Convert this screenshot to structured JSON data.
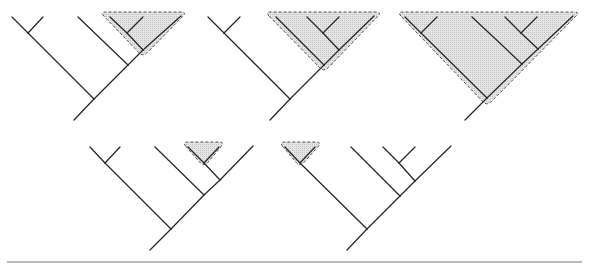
{
  "figure": {
    "colors": {
      "branch": "#2a2a2a",
      "clade_fill": "#d9d9d9",
      "clade_border": "#555555",
      "rule": "#777777"
    }
  },
  "trees": [
    {
      "id": "tree-1",
      "topology": "((A,B),(C,((D,E),F)))",
      "highlighted_clade": "(D,E),F",
      "root": [
        74,
        120
      ],
      "nodes": {
        "n1": [
          94,
          99
        ],
        "nAB": [
          28,
          33
        ],
        "n2": [
          128,
          65
        ],
        "n3": [
          143,
          50
        ],
        "nDE": [
          127,
          33
        ]
      },
      "leaves": {
        "A": [
          12,
          17
        ],
        "B": [
          43,
          17
        ],
        "C": [
          78,
          17
        ],
        "D": [
          110,
          17
        ],
        "E": [
          143,
          17
        ],
        "F": [
          181,
          16
        ]
      },
      "clade_shape": [
        [
          100,
          12
        ],
        [
          187,
          12
        ],
        [
          143,
          57
        ]
      ]
    },
    {
      "id": "tree-2",
      "topology": "((A,B),(C,((D,E),F)))",
      "highlighted_clade": "C,((D,E),F)",
      "root": [
        270,
        120
      ],
      "nodes": {
        "n1": [
          290,
          99
        ],
        "nAB": [
          224,
          33
        ],
        "n2": [
          324,
          65
        ],
        "n3": [
          339,
          50
        ],
        "nDE": [
          323,
          33
        ]
      },
      "leaves": {
        "A": [
          208,
          17
        ],
        "B": [
          240,
          17
        ],
        "C": [
          276,
          17
        ],
        "D": [
          307,
          17
        ],
        "E": [
          339,
          17
        ],
        "F": [
          374,
          16
        ]
      },
      "clade_shape": [
        [
          265,
          12
        ],
        [
          382,
          12
        ],
        [
          324,
          72
        ]
      ]
    },
    {
      "id": "tree-3",
      "topology": "((A,B),(C,((D,E),F)))",
      "highlighted_clade": "entire tree",
      "root": [
        465,
        120
      ],
      "nodes": {
        "n1": [
          487,
          98
        ],
        "nAB": [
          421,
          33
        ],
        "n2": [
          522,
          64
        ],
        "n3": [
          538,
          49
        ],
        "nDE": [
          521,
          33
        ]
      },
      "leaves": {
        "A": [
          405,
          17
        ],
        "B": [
          437,
          17
        ],
        "C": [
          472,
          17
        ],
        "D": [
          505,
          17
        ],
        "E": [
          537,
          17
        ],
        "F": [
          573,
          16
        ]
      },
      "clade_shape": [
        [
          397,
          12
        ],
        [
          580,
          12
        ],
        [
          487,
          106
        ]
      ]
    },
    {
      "id": "tree-4",
      "topology": "((A,B),(C,((D,E),F)))",
      "highlighted_clade": "D,E",
      "root": [
        150,
        250
      ],
      "nodes": {
        "n1": [
          171,
          229
        ],
        "nAB": [
          105,
          163
        ],
        "n2": [
          204,
          195
        ],
        "n3": [
          220,
          180
        ],
        "nDE": [
          204,
          163
        ]
      },
      "leaves": {
        "A": [
          90,
          147
        ],
        "B": [
          120,
          147
        ],
        "C": [
          155,
          147
        ],
        "D": [
          188,
          147
        ],
        "E": [
          219,
          147
        ],
        "F": [
          253,
          146
        ]
      },
      "clade_shape": [
        [
          182,
          142
        ],
        [
          225,
          142
        ],
        [
          204,
          167
        ]
      ]
    },
    {
      "id": "tree-5",
      "topology": "((A,B),(C,((D,E),F)))",
      "highlighted_clade": "A,B",
      "root": [
        347,
        250
      ],
      "nodes": {
        "n1": [
          367,
          229
        ],
        "nAB": [
          300,
          163
        ],
        "n2": [
          400,
          196
        ],
        "n3": [
          415,
          181
        ],
        "nDE": [
          399,
          163
        ]
      },
      "leaves": {
        "A": [
          285,
          147
        ],
        "B": [
          315,
          147
        ],
        "C": [
          351,
          147
        ],
        "D": [
          383,
          147
        ],
        "E": [
          415,
          147
        ],
        "F": [
          451,
          146
        ]
      },
      "clade_shape": [
        [
          279,
          142
        ],
        [
          322,
          142
        ],
        [
          300,
          167
        ]
      ]
    }
  ],
  "rule": {
    "x1": 7,
    "x2": 582,
    "y": 262
  }
}
